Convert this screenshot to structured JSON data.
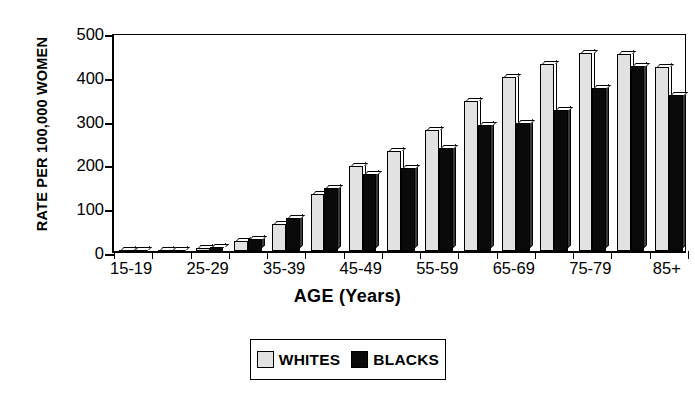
{
  "chart_data": {
    "type": "bar",
    "title": "",
    "xlabel": "AGE  (Years)",
    "ylabel": "RATE PER 100,000 WOMEN",
    "ylim": [
      0,
      500
    ],
    "yticks": [
      0,
      100,
      200,
      300,
      400,
      500
    ],
    "grid": false,
    "legend_position": "bottom-center",
    "categories": [
      "15-19",
      "20-24",
      "25-29",
      "30-34",
      "35-39",
      "40-44",
      "45-49",
      "50-54",
      "55-59",
      "60-64",
      "65-69",
      "70-74",
      "75-79",
      "80-84",
      "85+"
    ],
    "visible_tick_labels": [
      "15-19",
      "25-29",
      "35-39",
      "45-49",
      "55-59",
      "65-69",
      "75-79",
      "85+"
    ],
    "series": [
      {
        "name": "WHITES",
        "color": "#e2e2e2",
        "values": [
          1,
          2,
          8,
          22,
          62,
          130,
          195,
          228,
          277,
          342,
          398,
          428,
          452,
          450,
          420
        ]
      },
      {
        "name": "BLACKS",
        "color": "#0a0a0a",
        "values": [
          1,
          3,
          10,
          28,
          75,
          145,
          175,
          190,
          235,
          288,
          293,
          322,
          372,
          423,
          357
        ]
      }
    ]
  },
  "legend": {
    "items": [
      {
        "label": "WHITES",
        "swatch": "light-gray-square"
      },
      {
        "label": "BLACKS",
        "swatch": "black-square"
      }
    ]
  },
  "axis": {
    "y_title": "RATE PER 100,000 WOMEN",
    "x_title": "AGE  (Years)",
    "y_tick_labels": [
      "500",
      "400",
      "300",
      "200",
      "100",
      "0"
    ]
  }
}
